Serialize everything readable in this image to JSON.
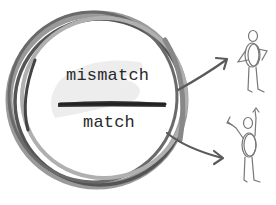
{
  "diagram": {
    "labels": {
      "top": "mismatch",
      "bottom": "match"
    },
    "icons": {
      "circle": "sketched-circle-icon",
      "divider": "brush-stroke-divider-icon",
      "arrow_top": "arrow-up-right-icon",
      "arrow_bottom": "arrow-down-right-icon",
      "figure_top": "stick-figure-holding-ring-icon",
      "figure_bottom": "stick-figure-cheering-icon"
    },
    "colors": {
      "circle_dark": "#555555",
      "circle_light": "#9a9a9a",
      "text": "#2a2a2a",
      "arrow": "#5a5a5a",
      "figure": "#777777",
      "wash": "#e4e4e4"
    }
  }
}
